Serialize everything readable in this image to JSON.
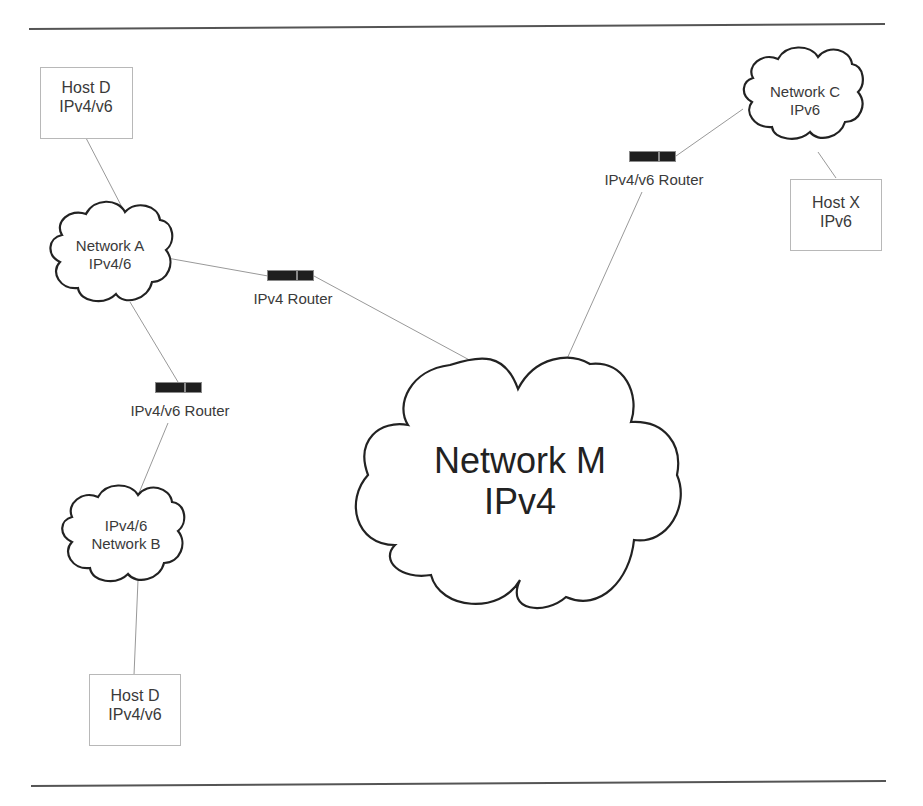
{
  "diagram": {
    "type": "network-topology",
    "nodes": {
      "host_d_top": {
        "line1": "Host D",
        "line2": "IPv4/v6"
      },
      "network_a": {
        "line1": "Network A",
        "line2": "IPv4/6"
      },
      "ipv4_router": {
        "label": "IPv4 Router"
      },
      "router_left": {
        "label": "IPv4/v6 Router"
      },
      "network_b": {
        "line1": "IPv4/6",
        "line2": "Network B"
      },
      "host_d_bottom": {
        "line1": "Host D",
        "line2": "IPv4/v6"
      },
      "network_m": {
        "line1": "Network M",
        "line2": "IPv4"
      },
      "router_right": {
        "label": "IPv4/v6 Router"
      },
      "network_c": {
        "line1": "Network C",
        "line2": "IPv6"
      },
      "host_x": {
        "line1": "Host X",
        "line2": "IPv6"
      }
    },
    "edges": [
      [
        "host_d_top",
        "network_a"
      ],
      [
        "network_a",
        "ipv4_router"
      ],
      [
        "ipv4_router",
        "network_m"
      ],
      [
        "network_a",
        "router_left"
      ],
      [
        "router_left",
        "network_b"
      ],
      [
        "network_b",
        "host_d_bottom"
      ],
      [
        "network_m",
        "router_right"
      ],
      [
        "router_right",
        "network_c"
      ],
      [
        "network_c",
        "host_x"
      ]
    ],
    "colors": {
      "rule": "#555555",
      "cloud_stroke": "#222222",
      "link": "#999999",
      "router_fill": "#1e1e1e",
      "box_border": "#b8b8b8",
      "text": "#3a3a3a"
    }
  }
}
